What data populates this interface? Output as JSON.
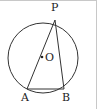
{
  "diagram": {
    "type": "circle-inscribed-triangle",
    "circle": {
      "center_label": "O",
      "cx": 43,
      "cy": 58,
      "r": 35
    },
    "points": [
      {
        "label": "P",
        "x": 55,
        "y": 20,
        "label_x": 51,
        "label_y": 10
      },
      {
        "label": "A",
        "x": 27,
        "y": 89,
        "label_x": 21,
        "label_y": 101
      },
      {
        "label": "B",
        "x": 64,
        "y": 89,
        "label_x": 62,
        "label_y": 101
      }
    ],
    "center_dot": {
      "x": 42,
      "y": 57
    },
    "center_label_pos": {
      "x": 45,
      "y": 61
    },
    "segments": [
      [
        "P",
        "A"
      ],
      [
        "P",
        "B"
      ],
      [
        "A",
        "B"
      ]
    ],
    "colors": {
      "stroke": "#333333",
      "border": "#c8c8c8",
      "background": "#ffffff"
    }
  }
}
